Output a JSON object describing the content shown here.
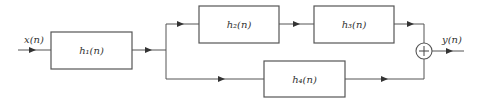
{
  "diagram": {
    "title": "",
    "input_label": "x(n)",
    "output_label": "y(n)",
    "blocks": [
      {
        "id": "h1",
        "label": "h₁(n)"
      },
      {
        "id": "h2",
        "label": "h₂(n)"
      },
      {
        "id": "h3",
        "label": "h₃(n)"
      },
      {
        "id": "h4",
        "label": "h₄(n)"
      }
    ],
    "summer": {
      "symbol": "+"
    },
    "colors": {
      "line": "#555555",
      "text": "#333333",
      "background": "#ffffff"
    }
  }
}
